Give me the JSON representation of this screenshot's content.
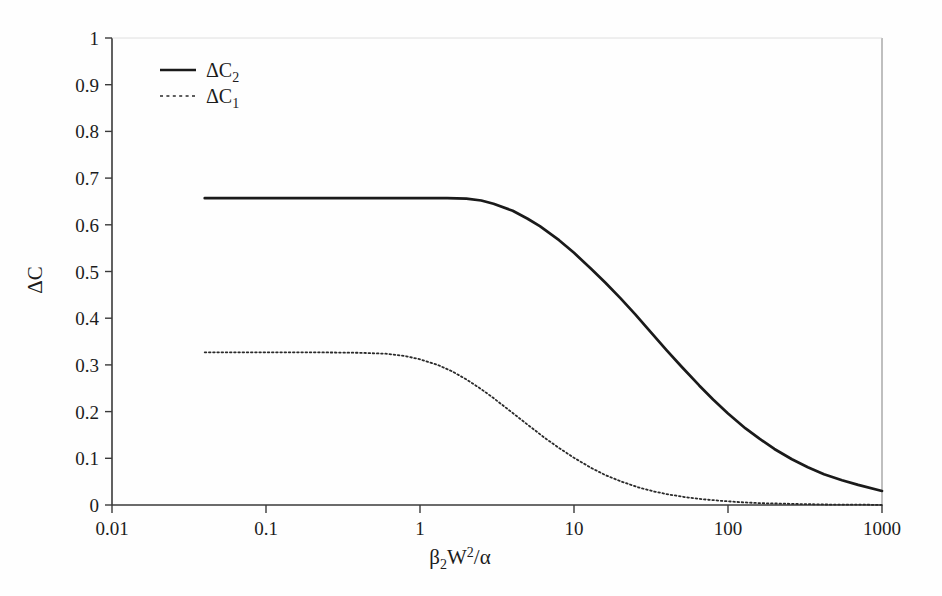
{
  "chart_data": {
    "type": "line",
    "title": "",
    "xlabel": "β₂W²/α",
    "ylabel": "ΔC",
    "xscale": "log",
    "yscale": "linear",
    "xlim": [
      0.01,
      1000
    ],
    "ylim": [
      0,
      1
    ],
    "grid": false,
    "legend_position": "top-left",
    "xticks": [
      0.01,
      0.1,
      1,
      10,
      100,
      1000
    ],
    "xtick_labels": [
      "0.01",
      "0.1",
      "1",
      "10",
      "100",
      "1000"
    ],
    "yticks": [
      0,
      0.1,
      0.2,
      0.3,
      0.4,
      0.5,
      0.6,
      0.7,
      0.8,
      0.9,
      1
    ],
    "ytick_labels": [
      "0",
      "0.1",
      "0.2",
      "0.3",
      "0.4",
      "0.5",
      "0.6",
      "0.7",
      "0.8",
      "0.9",
      "1"
    ],
    "series": [
      {
        "name": "ΔC₂",
        "style": "solid",
        "color": "#1a1a1a",
        "x": [
          0.04,
          0.07,
          0.1,
          0.2,
          0.4,
          0.7,
          1.0,
          1.5,
          2.0,
          2.5,
          3.0,
          4.0,
          5.0,
          6.0,
          8.0,
          10.0,
          13.0,
          16.0,
          20.0,
          25.0,
          30.0,
          40.0,
          50.0,
          65.0,
          80.0,
          100.0,
          130.0,
          160.0,
          200.0,
          260.0,
          330.0,
          420.0,
          550.0,
          700.0,
          1000.0
        ],
        "y": [
          0.657,
          0.657,
          0.657,
          0.657,
          0.657,
          0.657,
          0.657,
          0.657,
          0.656,
          0.652,
          0.645,
          0.63,
          0.613,
          0.597,
          0.567,
          0.54,
          0.505,
          0.476,
          0.443,
          0.408,
          0.378,
          0.331,
          0.296,
          0.256,
          0.226,
          0.196,
          0.164,
          0.142,
          0.12,
          0.098,
          0.081,
          0.066,
          0.053,
          0.043,
          0.03
        ]
      },
      {
        "name": "ΔC₁",
        "style": "dotted",
        "color": "#2a2a2a",
        "x": [
          0.04,
          0.07,
          0.1,
          0.2,
          0.4,
          0.6,
          0.8,
          1.0,
          1.3,
          1.6,
          2.0,
          2.5,
          3.0,
          4.0,
          5.0,
          6.5,
          8.0,
          10.0,
          13.0,
          16.0,
          20.0,
          26.0,
          33.0,
          42.0,
          55.0,
          70.0,
          90.0,
          120.0,
          160.0,
          220.0,
          300.0,
          450.0,
          700.0,
          1000.0
        ],
        "y": [
          0.327,
          0.327,
          0.327,
          0.327,
          0.326,
          0.324,
          0.319,
          0.312,
          0.3,
          0.287,
          0.269,
          0.248,
          0.229,
          0.197,
          0.172,
          0.143,
          0.122,
          0.101,
          0.079,
          0.064,
          0.051,
          0.038,
          0.029,
          0.022,
          0.016,
          0.012,
          0.009,
          0.006,
          0.004,
          0.003,
          0.002,
          0.001,
          0.001,
          0.0
        ]
      }
    ],
    "annotations": []
  },
  "legend": {
    "entries": [
      {
        "label_base": "ΔC",
        "label_sub": "2",
        "style": "solid"
      },
      {
        "label_base": "ΔC",
        "label_sub": "1",
        "style": "dotted"
      }
    ]
  },
  "axis": {
    "x_title_parts": {
      "beta": "β",
      "beta_sub": "2",
      "w": "W",
      "w_sup": "2",
      "slash": "/",
      "alpha": "α"
    },
    "y_title": "ΔC"
  }
}
